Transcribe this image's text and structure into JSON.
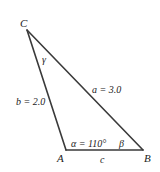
{
  "diagram": {
    "type": "triangle",
    "colors": {
      "line": "#3a3a3a",
      "text": "#222222",
      "background": "#ffffff"
    },
    "vertices": [
      {
        "id": "C",
        "label": "C",
        "x": 27,
        "y": 30
      },
      {
        "id": "A",
        "label": "A",
        "x": 66,
        "y": 150
      },
      {
        "id": "B",
        "label": "B",
        "x": 143,
        "y": 150
      }
    ],
    "sides": [
      {
        "id": "a",
        "label": "a = 3.0",
        "from": "C",
        "to": "B"
      },
      {
        "id": "b",
        "label": "b = 2.0",
        "from": "C",
        "to": "A"
      },
      {
        "id": "c",
        "label": "c",
        "from": "A",
        "to": "B"
      }
    ],
    "angles": [
      {
        "id": "alpha",
        "label": "α = 110°",
        "at": "A"
      },
      {
        "id": "beta",
        "label": "β",
        "at": "B"
      },
      {
        "id": "gamma",
        "label": "γ",
        "at": "C"
      }
    ]
  }
}
